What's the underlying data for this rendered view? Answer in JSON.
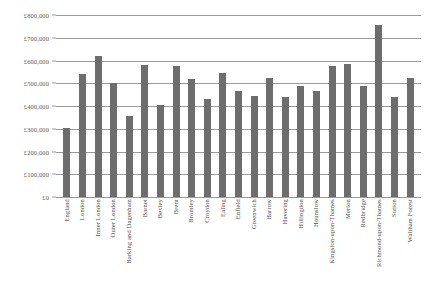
{
  "chart_data": {
    "type": "bar",
    "title": "",
    "subtitle": "",
    "xlabel": "",
    "ylabel": "",
    "ylim": [
      0,
      800000
    ],
    "y_tick_step": 100000,
    "grid": true,
    "legend": false,
    "bar_color": "#6d6d6d",
    "gridline_color": "#9a9a9a",
    "y_tick_labels": [
      "£800,000",
      "£700,000",
      "£600,000",
      "£500,000",
      "£400,000",
      "£300,000",
      "£200,000",
      "£100,000",
      "£0"
    ],
    "y_tick_values": [
      800000,
      700000,
      600000,
      500000,
      400000,
      300000,
      200000,
      100000,
      0
    ],
    "categories": [
      "England",
      "London",
      "Inner London",
      "Outer London",
      "Barking and Dagenham",
      "Barnet",
      "Bexley",
      "Brent",
      "Bromley",
      "Croydon",
      "Ealing",
      "Enfield",
      "Greenwich",
      "Harrow",
      "Havering",
      "Hillingdon",
      "Hounslow",
      "Kingston-upon-Thames",
      "Merton",
      "Redbridge",
      "Richmond-upon-Thames",
      "Sutton",
      "Waltham Forest"
    ],
    "values": [
      305000,
      540000,
      620000,
      500000,
      355000,
      580000,
      405000,
      575000,
      520000,
      430000,
      545000,
      465000,
      445000,
      525000,
      440000,
      490000,
      465000,
      575000,
      585000,
      490000,
      755000,
      440000,
      525000
    ]
  }
}
